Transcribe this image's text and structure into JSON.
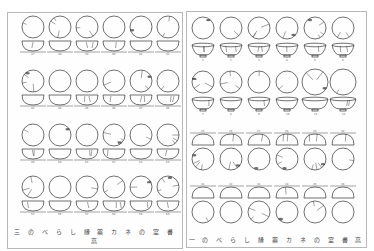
{
  "document": {
    "type": "scanned two-page plate of ceramic bowl drawings",
    "left_page": {
      "caption": "三 の べ ら し 縁 薬 カ ネ の 室 書 高",
      "rows": 4,
      "columns": 6,
      "row_numbers": [
        [
          "37",
          "38",
          "39",
          "40",
          "41",
          "42"
        ],
        [
          "43",
          "44",
          "45",
          "46",
          "47",
          "48"
        ],
        [
          "49",
          "50",
          "51",
          "52",
          "53",
          "54"
        ],
        [
          "55",
          "56",
          "57",
          "58",
          "59",
          "60"
        ]
      ]
    },
    "right_page": {
      "caption": "一 の べ ら し 縁 薬 カ ネ の 室 書 高",
      "rows": 4,
      "columns": 6,
      "row_numbers": [
        [
          "1",
          "2",
          "3",
          "4",
          "5",
          "6"
        ],
        [
          "7",
          "8",
          "9",
          "10",
          "11",
          "12"
        ],
        [
          "25",
          "26",
          "27",
          "28",
          "29",
          "30"
        ],
        [
          "31",
          "32",
          "33",
          "34",
          "35",
          "36"
        ]
      ]
    }
  }
}
